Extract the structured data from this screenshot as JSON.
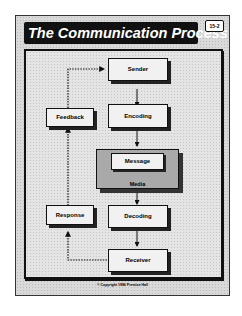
{
  "title": "The Communication Process",
  "badge": "15-2",
  "nodes": {
    "sender": "Sender",
    "encoding": "Encoding",
    "message": "Message",
    "media": "Media",
    "decoding": "Decoding",
    "receiver": "Receiver",
    "feedback": "Feedback",
    "response": "Response"
  },
  "copyright": "© Copyright 1996 Prentice Hall",
  "edges": [
    {
      "from": "Sender",
      "to": "Encoding",
      "style": "solid"
    },
    {
      "from": "Encoding",
      "to": "Message/Media",
      "style": "solid"
    },
    {
      "from": "Message/Media",
      "to": "Decoding",
      "style": "solid"
    },
    {
      "from": "Decoding",
      "to": "Receiver",
      "style": "solid"
    },
    {
      "from": "Receiver",
      "to": "Response",
      "style": "dotted"
    },
    {
      "from": "Response",
      "to": "Feedback",
      "style": "dotted"
    },
    {
      "from": "Feedback",
      "to": "Sender",
      "style": "dotted"
    }
  ]
}
